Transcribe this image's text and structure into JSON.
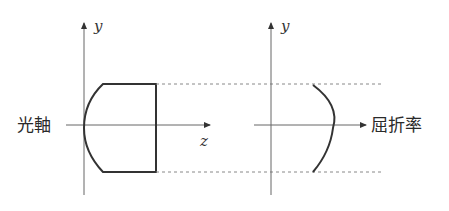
{
  "labels": {
    "optical_axis": "光軸",
    "y_left": "y",
    "z_axis": "z",
    "y_right": "y",
    "refractive_index": "屈折率"
  },
  "colors": {
    "axis": "#555555",
    "lens": "#333333",
    "dashed": "#777777",
    "text": "#2a2a2a"
  }
}
